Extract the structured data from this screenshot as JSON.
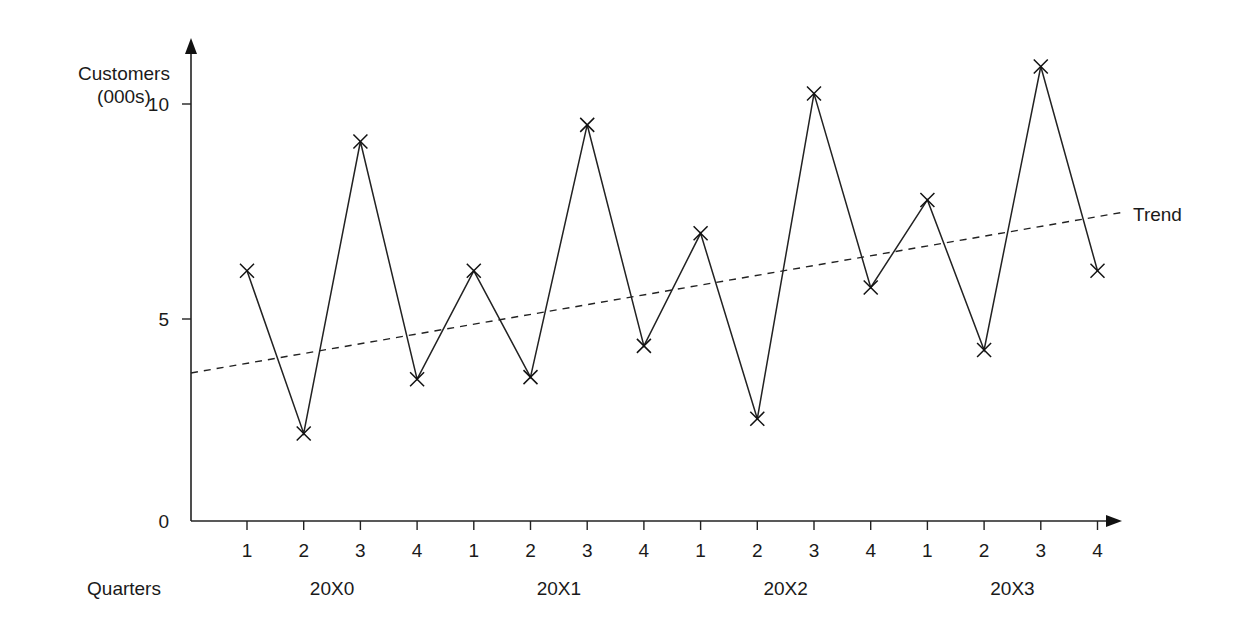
{
  "chart_data": {
    "type": "line",
    "title": "",
    "ylabel": "Customers (000s)",
    "ylabel_lines": [
      "Customers",
      "(000s)"
    ],
    "xlabel": "Quarters",
    "ylim": [
      0,
      11
    ],
    "yticks": [
      0,
      5,
      10
    ],
    "grid": false,
    "legend": "none",
    "years": [
      "20X0",
      "20X1",
      "20X2",
      "20X3"
    ],
    "quarter_labels": [
      "1",
      "2",
      "3",
      "4",
      "1",
      "2",
      "3",
      "4",
      "1",
      "2",
      "3",
      "4",
      "1",
      "2",
      "3",
      "4"
    ],
    "categories": [
      "20X0 Q1",
      "20X0 Q2",
      "20X0 Q3",
      "20X0 Q4",
      "20X1 Q1",
      "20X1 Q2",
      "20X1 Q3",
      "20X1 Q4",
      "20X2 Q1",
      "20X2 Q2",
      "20X2 Q3",
      "20X2 Q4",
      "20X3 Q1",
      "20X3 Q2",
      "20X3 Q3",
      "20X3 Q4"
    ],
    "series": [
      {
        "name": "Customers",
        "marker": "x",
        "style": "solid",
        "values": [
          6.0,
          2.1,
          9.1,
          3.4,
          6.0,
          3.45,
          9.5,
          4.2,
          6.9,
          2.45,
          10.25,
          5.6,
          7.7,
          4.1,
          10.9,
          6.0
        ]
      },
      {
        "name": "Trend",
        "style": "dashed",
        "start": 3.55,
        "end": 7.4
      }
    ],
    "annotations": [
      {
        "text": "Trend",
        "position": "right end of trend line"
      }
    ]
  }
}
